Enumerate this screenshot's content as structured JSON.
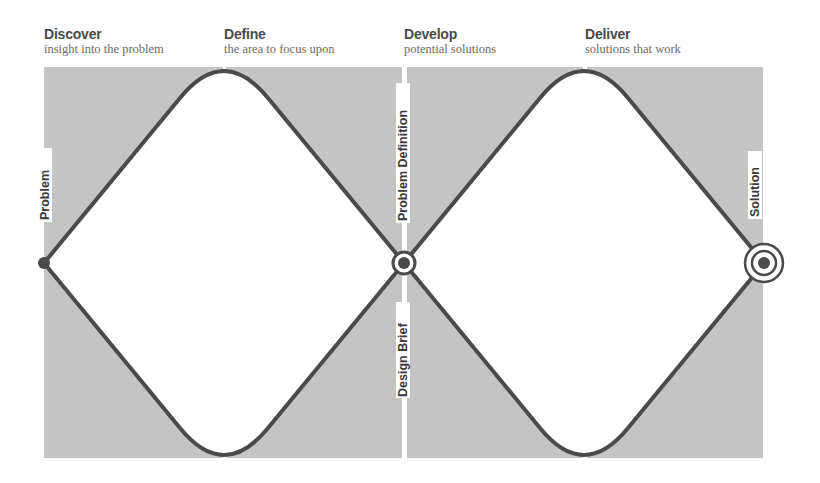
{
  "phases": [
    {
      "title": "Discover",
      "subtitle": "insight into the problem"
    },
    {
      "title": "Define",
      "subtitle": "the area to focus upon"
    },
    {
      "title": "Develop",
      "subtitle": "potential solutions"
    },
    {
      "title": "Deliver",
      "subtitle": "solutions that work"
    }
  ],
  "milestones": {
    "start": "Problem",
    "middle_top": "Problem Definition",
    "middle_bottom": "Design Brief",
    "end": "Solution"
  },
  "colors": {
    "panel": "#c4c4c4",
    "line": "#4a4a4a",
    "background": "#ffffff"
  }
}
